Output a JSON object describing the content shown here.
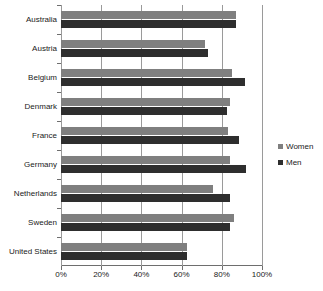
{
  "chart_data": {
    "type": "bar",
    "orientation": "horizontal",
    "title": "",
    "subtitle": "",
    "xlabel": "",
    "ylabel": "",
    "categories": [
      "Australia",
      "Austria",
      "Belgium",
      "Denmark",
      "France",
      "Germany",
      "Netherlands",
      "Sweden",
      "United States"
    ],
    "series": [
      {
        "name": "Women",
        "color": "#7f7f7f",
        "values": [
          87,
          71.5,
          85,
          84,
          83,
          84,
          75.5,
          86,
          62.5
        ]
      },
      {
        "name": "Men",
        "color": "#2e2e2e",
        "values": [
          87,
          73,
          91.5,
          82.5,
          88.5,
          92,
          84,
          84,
          62.5
        ]
      }
    ],
    "xlim": [
      0,
      100
    ],
    "xticks": [
      0,
      20,
      40,
      60,
      80,
      100
    ],
    "xtick_labels": [
      "0%",
      "20%",
      "40%",
      "60%",
      "80%",
      "100%"
    ],
    "grid": true,
    "grid_axis": "x",
    "legend_position": "right"
  },
  "legend": {
    "items": [
      {
        "label": "Women",
        "color": "#7f7f7f"
      },
      {
        "label": "Men",
        "color": "#2e2e2e"
      }
    ]
  }
}
